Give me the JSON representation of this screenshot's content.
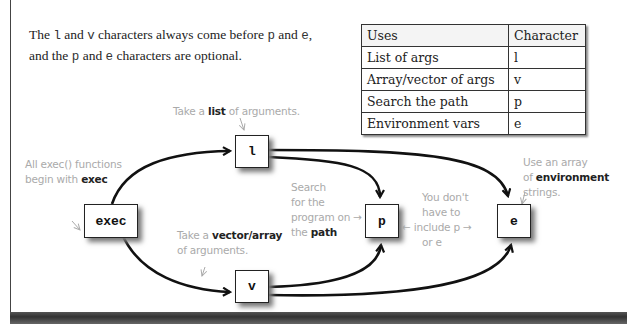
{
  "intro": {
    "line1_a": "The ",
    "line1_l": "l",
    "line1_b": " and ",
    "line1_v": "v",
    "line1_c": " characters always come before ",
    "line1_p": "p",
    "line1_d": " and ",
    "line1_e": "e",
    "line1_f": ",",
    "line2_a": "and the ",
    "line2_p": "p",
    "line2_b": " and ",
    "line2_e": "e",
    "line2_c": " characters are optional."
  },
  "table": {
    "headers": [
      "Uses",
      "Character"
    ],
    "rows": [
      [
        "List of args",
        "l"
      ],
      [
        "Array/vector of args",
        "v"
      ],
      [
        "Search the path",
        "p"
      ],
      [
        "Environment vars",
        "e"
      ]
    ]
  },
  "nodes": {
    "exec": "exec",
    "l": "l",
    "v": "v",
    "p": "p",
    "e": "e"
  },
  "notes": {
    "exec_note_1": "All exec() functions",
    "exec_note_2a": "begin with ",
    "exec_note_2b": "exec",
    "l_note_a": "Take a ",
    "l_note_b": "list",
    "l_note_c": " of arguments.",
    "v_note_1a": "Take a ",
    "v_note_1b": "vector/array",
    "v_note_2": "of arguments.",
    "p_note_1": "Search",
    "p_note_2": "for the",
    "p_note_3": "program on →",
    "p_note_4a": "the ",
    "p_note_4b": "path",
    "opt_note_1": "You don't",
    "opt_note_2": "have to",
    "opt_note_3": "← include p →",
    "opt_note_4": "or e",
    "e_note_1": "Use an array",
    "e_note_2a": "of ",
    "e_note_2b": "environment",
    "e_note_3": "strings."
  }
}
